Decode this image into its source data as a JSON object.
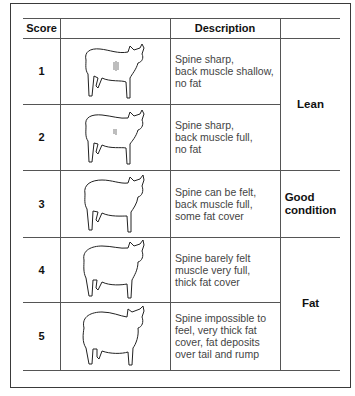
{
  "table": {
    "headers": [
      "Score",
      "",
      "Description",
      ""
    ],
    "rows": [
      {
        "score": "1",
        "description": [
          "Spine sharp,",
          "back muscle shallow,",
          "no fat"
        ],
        "illustration": "thin-sheep-icon"
      },
      {
        "score": "2",
        "description": [
          "Spine sharp,",
          "back muscle full,",
          "no fat"
        ],
        "illustration": "lean-sheep-icon"
      },
      {
        "score": "3",
        "description": [
          "Spine can be felt,",
          "back muscle full,",
          "some fat cover"
        ],
        "illustration": "good-sheep-icon"
      },
      {
        "score": "4",
        "description": [
          "Spine barely felt",
          "muscle very full,",
          "thick fat cover"
        ],
        "illustration": "fat-sheep-icon"
      },
      {
        "score": "5",
        "description": [
          "Spine impossible to",
          "feel, very thick fat",
          "cover, fat deposits",
          "over tail and rump"
        ],
        "illustration": "very-fat-sheep-icon"
      }
    ],
    "categories": [
      {
        "label": "Lean",
        "rows": "1-2"
      },
      {
        "label_line1": "Good",
        "label_line2": "condition",
        "rows": "3"
      },
      {
        "label": "Fat",
        "rows": "4-5"
      }
    ]
  }
}
